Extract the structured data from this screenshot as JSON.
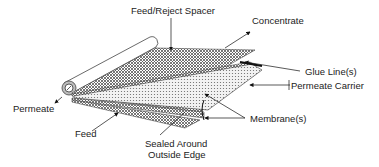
{
  "diagram": {
    "labels": {
      "feed_reject_spacer": "Feed/Reject Spacer",
      "concentrate": "Concentrate",
      "glue_lines": "Glue Line(s)",
      "permeate_carrier": "Permeate Carrier",
      "permeate": "Permeate",
      "feed": "Feed",
      "sealed_line1": "Sealed Around",
      "sealed_line2": "Outside Edge",
      "membranes": "Membrane(s)"
    },
    "components": [
      "permeate-tube",
      "feed-reject-spacer-sheet",
      "membrane-top",
      "permeate-carrier",
      "membrane-bottom",
      "glue-lines"
    ],
    "colors": {
      "line": "#222222",
      "spacer_fill": "#9a9a9a",
      "carrier_fill": "#d8d8d8",
      "background": "#ffffff"
    }
  }
}
